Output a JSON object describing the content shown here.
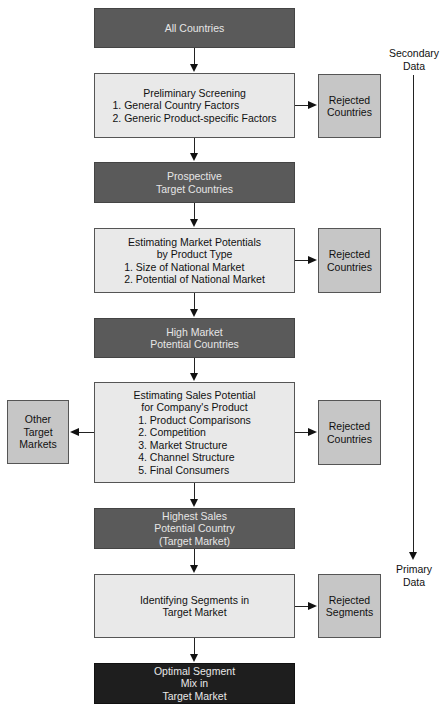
{
  "flow": {
    "all_countries": "All Countries",
    "preliminary": {
      "title": "Preliminary Screening",
      "items": [
        "1. General Country Factors",
        "2. Generic Product-specific Factors"
      ]
    },
    "prospective": [
      "Prospective",
      "Target Countries"
    ],
    "market_potentials": {
      "title": [
        "Estimating Market Potentials",
        "by Product Type"
      ],
      "items": [
        "1. Size of National Market",
        "2. Potential of National Market"
      ]
    },
    "high_market": [
      "High Market",
      "Potential Countries"
    ],
    "sales_potential": {
      "title": [
        "Estimating Sales Potential",
        "for Company's Product"
      ],
      "items": [
        "1. Product Comparisons",
        "2. Competition",
        "3. Market Structure",
        "4. Channel Structure",
        "5. Final Consumers"
      ]
    },
    "highest_sales": [
      "Highest Sales",
      "Potential Country",
      "(Target Market)"
    ],
    "identifying": [
      "Identifying Segments in",
      "Target Market"
    ],
    "optimal": [
      "Optimal Segment",
      "Mix in",
      "Target Market"
    ]
  },
  "side": {
    "rejected_1": [
      "Rejected",
      "Countries"
    ],
    "rejected_2": [
      "Rejected",
      "Countries"
    ],
    "rejected_3": [
      "Rejected",
      "Countries"
    ],
    "rejected_4": [
      "Rejected",
      "Segments"
    ],
    "other_markets": [
      "Other",
      "Target",
      "Markets"
    ]
  },
  "data_axis": {
    "top": [
      "Secondary",
      "Data"
    ],
    "bottom": [
      "Primary",
      "Data"
    ]
  }
}
